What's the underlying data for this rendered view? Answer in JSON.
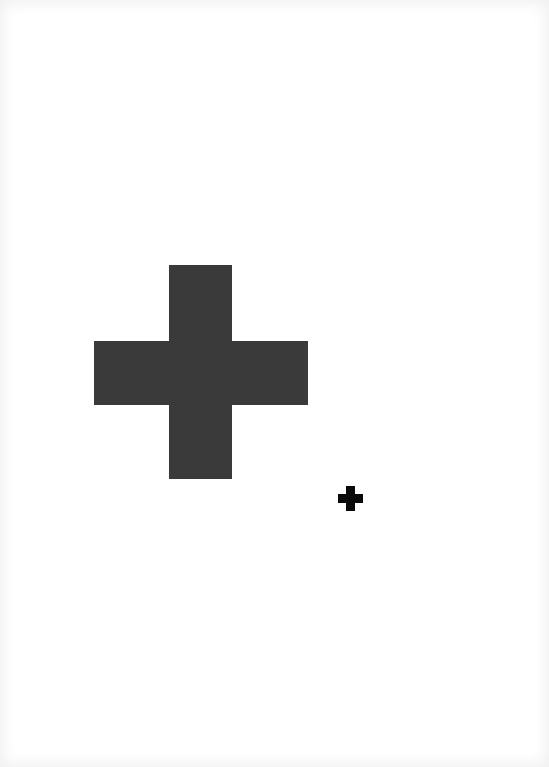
{
  "document": {
    "background_color": "#ffffff",
    "shapes": [
      {
        "name": "large-cross",
        "type": "plus",
        "color": "#3a3a3a",
        "vertical": {
          "x": 169,
          "y": 265,
          "w": 63,
          "h": 214
        },
        "horizontal": {
          "x": 94,
          "y": 341,
          "w": 214,
          "h": 64
        }
      },
      {
        "name": "small-cross",
        "type": "plus",
        "color": "#0a0a0a",
        "vertical": {
          "x": 346,
          "y": 486,
          "w": 9,
          "h": 25
        },
        "horizontal": {
          "x": 338,
          "y": 494,
          "w": 25,
          "h": 9
        }
      }
    ]
  }
}
